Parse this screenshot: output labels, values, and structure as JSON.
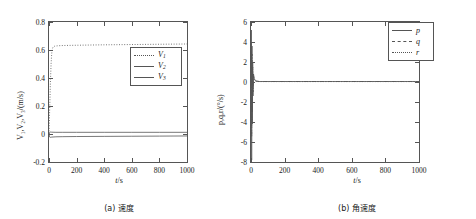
{
  "figure": {
    "panels": [
      {
        "id": "panel-a",
        "caption": "(a) 速度",
        "xlabel_var": "t",
        "xlabel_unit": "/s",
        "ylabel": "V₁,V₂,V₃/(m/s)",
        "legend": [
          {
            "label": "V",
            "sub": "1",
            "style": "dot"
          },
          {
            "label": "V",
            "sub": "2",
            "style": "solid"
          },
          {
            "label": "V",
            "sub": "3",
            "style": "solid"
          }
        ]
      },
      {
        "id": "panel-b",
        "caption": "(b) 角速度",
        "xlabel_var": "t",
        "xlabel_unit": "/s",
        "ylabel": "p,q,r/(°/s)",
        "legend": [
          {
            "label": "p",
            "sub": "",
            "style": "solid"
          },
          {
            "label": "q",
            "sub": "",
            "style": "dashdot"
          },
          {
            "label": "r",
            "sub": "",
            "style": "dot"
          }
        ]
      }
    ]
  },
  "chart_data": [
    {
      "type": "line",
      "title": "(a) 速度",
      "xlabel": "t/s",
      "ylabel": "V1,V2,V3/(m/s)",
      "xlim": [
        0,
        1000
      ],
      "ylim": [
        -0.2,
        0.8
      ],
      "xticks": [
        0,
        200,
        400,
        600,
        800,
        1000
      ],
      "yticks": [
        -0.2,
        0,
        0.2,
        0.4,
        0.6,
        0.8
      ],
      "xtick_labels": [
        "0",
        "200",
        "400",
        "600",
        "800",
        "1000"
      ],
      "ytick_labels": [
        "-0.2",
        "0",
        "0.2",
        "0.4",
        "0.6",
        "0.8"
      ],
      "grid": false,
      "legend_position": "center-right",
      "series": [
        {
          "name": "V1",
          "style": "dotted",
          "x": [
            0,
            5,
            10,
            15,
            20,
            25,
            30,
            40,
            60,
            100,
            200,
            400,
            600,
            800,
            1000
          ],
          "values": [
            0,
            0.18,
            0.36,
            0.5,
            0.58,
            0.61,
            0.622,
            0.627,
            0.63,
            0.632,
            0.634,
            0.637,
            0.639,
            0.641,
            0.643
          ]
        },
        {
          "name": "V2",
          "style": "solid",
          "x": [
            0,
            5,
            10,
            20,
            50,
            100,
            200,
            400,
            600,
            800,
            1000
          ],
          "values": [
            0,
            0.012,
            0.014,
            0.013,
            0.012,
            0.012,
            0.012,
            0.012,
            0.012,
            0.012,
            0.012
          ]
        },
        {
          "name": "V3",
          "style": "solid",
          "x": [
            0,
            5,
            10,
            20,
            50,
            100,
            200,
            400,
            600,
            800,
            1000
          ],
          "values": [
            0,
            -0.022,
            -0.024,
            -0.022,
            -0.02,
            -0.019,
            -0.018,
            -0.017,
            -0.016,
            -0.015,
            -0.014
          ]
        }
      ]
    },
    {
      "type": "line",
      "title": "(b) 角速度",
      "xlabel": "t/s",
      "ylabel": "p,q,r/(°/s)",
      "xlim": [
        0,
        1000
      ],
      "ylim": [
        -8,
        6
      ],
      "xticks": [
        0,
        200,
        400,
        600,
        800,
        1000
      ],
      "yticks": [
        -8,
        -6,
        -4,
        -2,
        0,
        2,
        4,
        6
      ],
      "xtick_labels": [
        "0",
        "200",
        "400",
        "600",
        "800",
        "1000"
      ],
      "ytick_labels": [
        "-8",
        "-6",
        "-4",
        "-2",
        "0",
        "2",
        "4",
        "6"
      ],
      "grid": false,
      "legend_position": "top-right",
      "series": [
        {
          "name": "p",
          "style": "solid",
          "x": [
            0,
            2,
            4,
            6,
            8,
            10,
            12,
            15,
            20,
            30,
            50,
            100,
            300,
            600,
            1000
          ],
          "values": [
            0,
            5.2,
            -7.8,
            3.6,
            -4.2,
            2.0,
            -1.4,
            0.8,
            0.3,
            0.1,
            0.05,
            0.05,
            0.05,
            0.05,
            0.05
          ]
        },
        {
          "name": "q",
          "style": "dashdot",
          "x": [
            0,
            2,
            4,
            6,
            8,
            10,
            12,
            15,
            20,
            30,
            50,
            100,
            300,
            600,
            1000
          ],
          "values": [
            0,
            4.0,
            -5.5,
            2.8,
            -3.0,
            1.5,
            -1.0,
            0.6,
            0.2,
            0.08,
            0.05,
            0.05,
            0.05,
            0.05,
            0.05
          ]
        },
        {
          "name": "r",
          "style": "dotted",
          "x": [
            0,
            2,
            4,
            6,
            8,
            10,
            12,
            15,
            20,
            30,
            50,
            100,
            300,
            600,
            1000
          ],
          "values": [
            0,
            3.0,
            -4.0,
            2.0,
            -2.2,
            1.1,
            -0.7,
            0.4,
            0.15,
            0.06,
            0.04,
            0.04,
            0.04,
            0.04,
            0.04
          ]
        }
      ]
    }
  ]
}
